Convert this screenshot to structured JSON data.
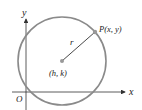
{
  "diagram": {
    "axes": {
      "x_label": "x",
      "y_label": "y",
      "origin_label": "O"
    },
    "center_label": "(h, k)",
    "radius_label": "r",
    "point_label": "P(x, y)",
    "colors": {
      "circle": "#8a8a8a",
      "axis": "#333333",
      "radius": "#333333",
      "point": "#999999"
    }
  }
}
